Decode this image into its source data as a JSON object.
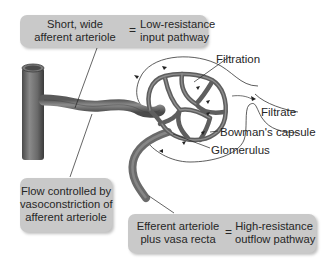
{
  "diagram": {
    "title": "",
    "boxes": {
      "top": {
        "left_line1": "Short, wide",
        "left_line2": "afferent arteriole",
        "operator": "=",
        "right_line1": "Low-resistance",
        "right_line2": "input pathway"
      },
      "left": {
        "line1": "Flow controlled by",
        "line2": "vasoconstriction of",
        "line3": "afferent arteriole"
      },
      "bottom": {
        "left_line1": "Efferent arteriole",
        "left_line2": "plus vasa recta",
        "operator": "=",
        "right_line1": "High-resistance",
        "right_line2": "outflow pathway"
      }
    },
    "labels": {
      "filtration": "Filtration",
      "filtrate": "Filtrate",
      "bowmans_capsule": "Bowman's capsule",
      "glomerulus": "Glomerulus"
    },
    "colors": {
      "box_fill": "#c9c9c9",
      "vessel": "#6e6e6e",
      "vessel_dark": "#3f3f3f",
      "line": "#333333"
    }
  }
}
